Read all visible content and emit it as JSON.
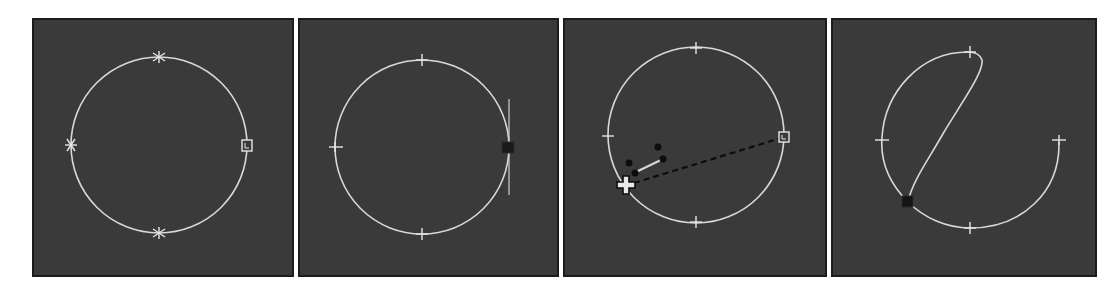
{
  "figure": {
    "background_color": "#ffffff",
    "panel_color": "#3a3a3a",
    "curve_color": "#d8d8d8",
    "handle_color": "#111111",
    "panels": [
      {
        "id": 1,
        "caption": "",
        "state": "circle with star vertices and first-vertex square marker",
        "vertices": [
          {
            "pos": "top",
            "marker": "star"
          },
          {
            "pos": "left",
            "marker": "star"
          },
          {
            "pos": "bottom",
            "marker": "star"
          },
          {
            "pos": "right",
            "marker": "first-vertex-square"
          }
        ]
      },
      {
        "id": 2,
        "caption": "",
        "state": "right vertex selected, tangent handle line shown",
        "vertices": [
          {
            "pos": "top",
            "marker": "tick"
          },
          {
            "pos": "left",
            "marker": "tick"
          },
          {
            "pos": "bottom",
            "marker": "tick"
          },
          {
            "pos": "right",
            "marker": "selected-square"
          }
        ]
      },
      {
        "id": 3,
        "caption": "",
        "state": "dragging vertex with move cursor, dashed rubber-band line",
        "vertices": [
          {
            "pos": "top",
            "marker": "tick"
          },
          {
            "pos": "left",
            "marker": "tick"
          },
          {
            "pos": "bottom",
            "marker": "tick"
          },
          {
            "pos": "right",
            "marker": "first-vertex-square"
          }
        ],
        "cursor": "move-cross"
      },
      {
        "id": 4,
        "caption": "",
        "state": "vertex moved, curve reshaped into open S-shaped contour",
        "vertices": [
          {
            "pos": "top",
            "marker": "tick"
          },
          {
            "pos": "left",
            "marker": "tick"
          },
          {
            "pos": "bottom",
            "marker": "tick"
          },
          {
            "pos": "right",
            "marker": "tick"
          },
          {
            "pos": "lower-left",
            "marker": "selected-square"
          }
        ]
      }
    ]
  }
}
